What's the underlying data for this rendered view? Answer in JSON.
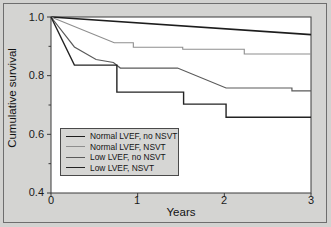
{
  "figure": {
    "title": "",
    "background_color": "#d4d4d2",
    "frame_color": "#6e6e6e"
  },
  "axes": {
    "y_label": "Cumulative survival",
    "x_label": "Years",
    "y_ticks": [
      "1.0",
      "0.8",
      "0.6",
      "0.4"
    ],
    "x_ticks": [
      "0",
      "1",
      "2",
      "3"
    ]
  },
  "legend": {
    "items": [
      {
        "label": "Normal LVEF, no NSVT",
        "color": "#1d1d1d",
        "width": 1.6
      },
      {
        "label": "Normal LVEF, NSVT",
        "color": "#8e8e8e",
        "width": 1.1
      },
      {
        "label": "Low LVEF, no NSVT",
        "color": "#5a5a5a",
        "width": 1.2
      },
      {
        "label": "Low LVEF, NSVT",
        "color": "#232323",
        "width": 1.4
      }
    ]
  },
  "chart_data": {
    "type": "line",
    "title": "",
    "xlabel": "Years",
    "ylabel": "Cumulative survival",
    "xlim": [
      0,
      3
    ],
    "ylim": [
      0.4,
      1.0
    ],
    "grid": false,
    "legend_position": "lower-left",
    "x_ticks": [
      0,
      1,
      2,
      3
    ],
    "y_ticks": [
      0.4,
      0.6,
      0.8,
      1.0
    ],
    "y_minor_ticks": [
      0.5,
      0.7,
      0.9
    ],
    "curve_style": "kaplan-meier step / survival",
    "series": [
      {
        "name": "Normal LVEF, no NSVT",
        "color": "#1d1d1d",
        "line_width": 1.6,
        "points": [
          [
            0.0,
            1.0
          ],
          [
            3.0,
            0.94
          ]
        ]
      },
      {
        "name": "Normal LVEF, NSVT",
        "color": "#8e8e8e",
        "line_width": 1.1,
        "points": [
          [
            0.0,
            1.0
          ],
          [
            0.73,
            0.912
          ],
          [
            0.95,
            0.912
          ],
          [
            0.95,
            0.897
          ],
          [
            1.52,
            0.897
          ],
          [
            1.52,
            0.89
          ],
          [
            2.23,
            0.89
          ],
          [
            2.23,
            0.874
          ],
          [
            3.0,
            0.874
          ]
        ]
      },
      {
        "name": "Low LVEF, no NSVT",
        "color": "#5a5a5a",
        "line_width": 1.2,
        "points": [
          [
            0.0,
            1.0
          ],
          [
            0.27,
            0.898
          ],
          [
            0.52,
            0.855
          ],
          [
            0.72,
            0.845
          ],
          [
            0.8,
            0.826
          ],
          [
            1.46,
            0.826
          ],
          [
            2.02,
            0.758
          ],
          [
            2.78,
            0.758
          ],
          [
            2.78,
            0.748
          ],
          [
            3.0,
            0.748
          ]
        ]
      },
      {
        "name": "Low LVEF, NSVT",
        "color": "#232323",
        "line_width": 1.4,
        "points": [
          [
            0.0,
            1.0
          ],
          [
            0.27,
            0.836
          ],
          [
            0.76,
            0.836
          ],
          [
            0.76,
            0.744
          ],
          [
            1.53,
            0.744
          ],
          [
            1.53,
            0.703
          ],
          [
            2.02,
            0.703
          ],
          [
            2.02,
            0.658
          ],
          [
            3.0,
            0.658
          ]
        ]
      }
    ]
  }
}
